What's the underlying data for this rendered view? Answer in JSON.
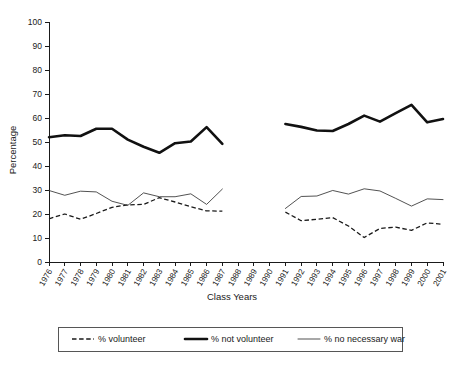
{
  "chart_data": {
    "type": "line",
    "title": "",
    "xlabel": "Class Years",
    "ylabel": "Percentage",
    "ylim": [
      0,
      100
    ],
    "ytick_step": 10,
    "yticks": [
      "0",
      "10",
      "20",
      "30",
      "40",
      "50",
      "60",
      "70",
      "80",
      "90",
      "100"
    ],
    "grid": false,
    "legend_position": "bottom",
    "categories": [
      "1976",
      "1977",
      "1978",
      "1979",
      "1980",
      "1981",
      "1982",
      "1983",
      "1984",
      "1985",
      "1986",
      "1987",
      "1988",
      "1989",
      "1990",
      "1991",
      "1992",
      "1993",
      "1994",
      "1995",
      "1996",
      "1997",
      "1998",
      "1999",
      "2000",
      "2001"
    ],
    "note": "Data gap between 1987 and 1991; no data plotted for 1988, 1989, 1990.",
    "series": [
      {
        "name": "% volunteer",
        "style": "dashed",
        "color": "#1a1a1a",
        "values": [
          18.0,
          20.0,
          17.8,
          20.2,
          22.8,
          23.8,
          24.0,
          26.8,
          25.0,
          23.0,
          21.3,
          21.2,
          null,
          null,
          null,
          20.8,
          17.2,
          17.8,
          18.5,
          15.0,
          10.2,
          14.0,
          14.5,
          13.2,
          16.3,
          15.7
        ]
      },
      {
        "name": "% not volunteer",
        "style": "thick-solid",
        "color": "#111111",
        "values": [
          52.0,
          52.8,
          52.5,
          55.5,
          51.0,
          48.0,
          45.5,
          49.5,
          50.2,
          56.2,
          49.2,
          null,
          null,
          null,
          null,
          57.5,
          56.3,
          54.8,
          57.5,
          61.0,
          58.5,
          62.0,
          65.5,
          58.2,
          59.6,
          null
        ],
        "values_by_year": {
          "1976": 52.0,
          "1977": 52.8,
          "1978": 52.5,
          "1979": 55.5,
          "1980": 55.5,
          "1981": 51.0,
          "1982": 48.0,
          "1983": 45.5,
          "1984": 49.5,
          "1985": 50.2,
          "1986": 56.2,
          "1987": 49.2,
          "1991": 57.5,
          "1992": 56.3,
          "1993": 54.8,
          "1994": 54.6,
          "1995": 57.5,
          "1996": 61.0,
          "1997": 58.5,
          "1998": 62.0,
          "1999": 65.5,
          "2000": 58.2,
          "2001": 59.6
        }
      },
      {
        "name": "% no necessary war",
        "style": "thin-solid",
        "color": "#333333",
        "values_by_year": {
          "1976": 29.8,
          "1977": 27.8,
          "1978": 29.5,
          "1979": 29.2,
          "1980": 25.3,
          "1981": 23.6,
          "1982": 28.8,
          "1983": 27.2,
          "1984": 27.2,
          "1985": 28.4,
          "1986": 24.0,
          "1987": 30.4,
          "1991": 22.3,
          "1992": 27.3,
          "1993": 27.5,
          "1994": 29.8,
          "1995": 28.3,
          "1996": 30.5,
          "1997": 29.6,
          "1998": 26.5,
          "1999": 23.3,
          "2000": 26.3,
          "2001": 26.0
        }
      }
    ]
  },
  "axes": {
    "y_title": "Percentage",
    "x_title": "Class Years"
  },
  "legend": {
    "items": [
      {
        "label": "% volunteer",
        "marker": "dashed-line-icon"
      },
      {
        "label": "% not volunteer",
        "marker": "thick-line-icon"
      },
      {
        "label": "% no necessary war",
        "marker": "thin-line-icon"
      }
    ]
  }
}
